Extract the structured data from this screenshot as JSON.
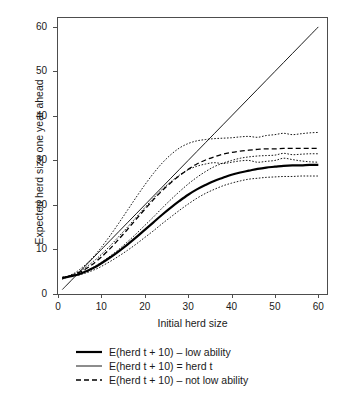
{
  "chart_data": {
    "type": "line",
    "title": "",
    "xlabel": "Initial herd size",
    "ylabel": "Expected herd size one year ahead",
    "xlim": [
      0,
      62
    ],
    "ylim": [
      0,
      62
    ],
    "xticks": [
      0,
      10,
      20,
      30,
      40,
      50,
      60
    ],
    "yticks": [
      0,
      10,
      20,
      30,
      40,
      50,
      60
    ],
    "grid": false,
    "legend_position": "bottom",
    "x": [
      1,
      2,
      3,
      4,
      5,
      6,
      7,
      8,
      9,
      10,
      12,
      14,
      16,
      18,
      20,
      22,
      24,
      26,
      28,
      30,
      32,
      34,
      36,
      38,
      40,
      42,
      44,
      46,
      48,
      50,
      52,
      54,
      56,
      58,
      60
    ],
    "series": [
      {
        "name": "E(herd t + 10) - low ability",
        "style": "solid-thick",
        "values": [
          3.6,
          3.8,
          4.0,
          4.2,
          4.5,
          4.9,
          5.3,
          5.8,
          6.3,
          6.9,
          8.2,
          9.6,
          11.1,
          12.7,
          14.4,
          16.1,
          17.8,
          19.4,
          20.9,
          22.3,
          23.5,
          24.5,
          25.4,
          26.1,
          26.8,
          27.3,
          27.7,
          28.1,
          28.4,
          28.6,
          28.8,
          28.9,
          28.9,
          29.0,
          29.0
        ]
      },
      {
        "name": "E(herd t + 10) = herd t",
        "style": "solid-thin",
        "values": [
          1,
          2,
          3,
          4,
          5,
          6,
          7,
          8,
          9,
          10,
          12,
          14,
          16,
          18,
          20,
          22,
          24,
          26,
          28,
          30,
          32,
          34,
          36,
          38,
          40,
          42,
          44,
          46,
          48,
          50,
          52,
          54,
          56,
          58,
          60
        ]
      },
      {
        "name": "E(herd t + 10) - not low ability",
        "style": "dashed",
        "values": [
          3.5,
          3.8,
          4.1,
          4.4,
          4.9,
          5.4,
          6.0,
          6.7,
          7.5,
          8.3,
          10.2,
          12.3,
          14.5,
          16.8,
          19.0,
          21.2,
          23.2,
          25.0,
          26.6,
          28.0,
          29.2,
          30.1,
          30.8,
          31.4,
          31.8,
          32.1,
          32.3,
          32.5,
          32.6,
          32.6,
          32.7,
          32.7,
          32.7,
          32.7,
          32.7
        ]
      },
      {
        "name": "upper confidence band - not low ability",
        "style": "dotted",
        "values": [
          3.3,
          3.8,
          4.3,
          4.8,
          5.5,
          6.3,
          7.2,
          8.2,
          9.3,
          10.5,
          13.1,
          15.9,
          18.8,
          21.7,
          24.5,
          27.1,
          29.4,
          31.3,
          32.8,
          33.8,
          34.4,
          34.7,
          34.9,
          35.0,
          35.1,
          35.3,
          35.4,
          35.2,
          35.6,
          35.8,
          36.1,
          35.8,
          36.0,
          36.2,
          36.3
        ]
      },
      {
        "name": "lower confidence band - not low ability",
        "style": "dotted",
        "values": [
          3.7,
          3.9,
          4.1,
          4.3,
          4.6,
          5.0,
          5.4,
          5.9,
          6.5,
          7.1,
          8.5,
          10.0,
          11.7,
          13.5,
          15.4,
          17.3,
          19.3,
          21.2,
          23.0,
          24.7,
          26.2,
          27.5,
          28.6,
          29.4,
          30.0,
          30.5,
          30.8,
          31.0,
          31.1,
          31.2,
          31.6,
          31.3,
          31.4,
          31.5,
          31.5
        ]
      },
      {
        "name": "upper confidence band - low ability",
        "style": "dotted",
        "values": [
          3.4,
          3.8,
          4.2,
          4.6,
          5.1,
          5.7,
          6.4,
          7.2,
          8.0,
          8.9,
          10.8,
          12.9,
          15.0,
          17.2,
          19.4,
          21.5,
          23.5,
          25.2,
          26.7,
          27.9,
          28.7,
          29.2,
          29.5,
          29.3,
          29.6,
          29.9,
          30.0,
          29.6,
          29.8,
          30.0,
          30.5,
          30.2,
          29.9,
          29.7,
          29.6
        ]
      },
      {
        "name": "lower confidence band - low ability",
        "style": "dotted",
        "values": [
          3.8,
          3.9,
          4.0,
          4.1,
          4.3,
          4.6,
          4.9,
          5.3,
          5.7,
          6.2,
          7.3,
          8.5,
          9.8,
          11.2,
          12.7,
          14.2,
          15.8,
          17.3,
          18.8,
          20.2,
          21.5,
          22.6,
          23.5,
          24.3,
          24.9,
          25.4,
          25.8,
          26.0,
          26.2,
          26.3,
          26.4,
          26.4,
          26.5,
          26.5,
          26.5
        ]
      }
    ],
    "legend": [
      {
        "label": "E(herd t + 10) – low ability",
        "style": "solid-thick"
      },
      {
        "label": "E(herd t + 10) = herd t",
        "style": "solid-thin"
      },
      {
        "label": "E(herd t + 10) – not low ability",
        "style": "dashed"
      }
    ]
  }
}
